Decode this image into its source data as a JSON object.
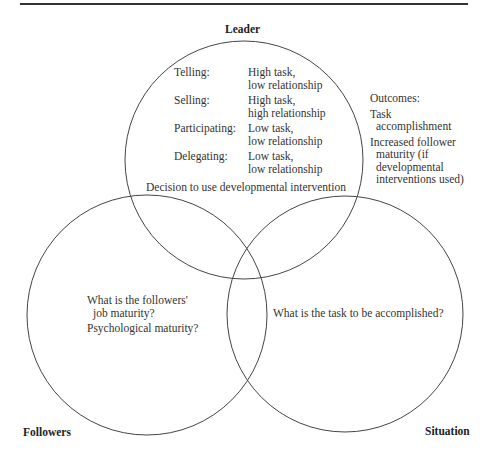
{
  "labels": {
    "leader": "Leader",
    "followers": "Followers",
    "situation": "Situation"
  },
  "leader_styles": [
    {
      "style": "Telling:",
      "desc_line1": "High task,",
      "desc_line2": "low relationship"
    },
    {
      "style": "Selling:",
      "desc_line1": "High task,",
      "desc_line2": "high relationship"
    },
    {
      "style": "Participating:",
      "desc_line1": "Low task,",
      "desc_line2": "low relationship"
    },
    {
      "style": "Delegating:",
      "desc_line1": "Low task,",
      "desc_line2": "low relationship"
    }
  ],
  "decision_text": "Decision to use developmental intervention",
  "outcomes": {
    "title": "Outcomes:",
    "item1_line1": "Task",
    "item1_line2": "accomplishment",
    "item2_line1": "Increased follower",
    "item2_line2": "maturity (if",
    "item2_line3": "developmental",
    "item2_line4": "interventions used)"
  },
  "followers_questions": {
    "q1_line1": "What is the followers'",
    "q1_line2": "job maturity?",
    "q2": "Psychological maturity?"
  },
  "situation_question": "What is the task to be accomplished?",
  "circles": [
    {
      "name": "leader",
      "cx": 244,
      "cy": 160,
      "r": 119
    },
    {
      "name": "followers",
      "cx": 147,
      "cy": 315,
      "r": 120
    },
    {
      "name": "situation",
      "cx": 345,
      "cy": 314,
      "r": 118
    }
  ],
  "colors": {
    "stroke": "#444444",
    "rule": "#333333",
    "text": "#333333"
  }
}
